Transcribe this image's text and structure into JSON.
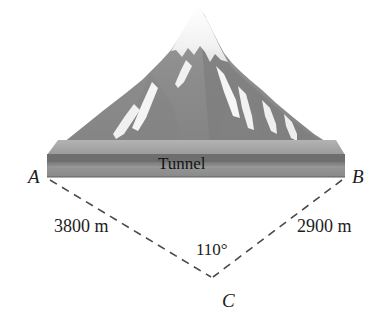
{
  "figure": {
    "type": "geometry-diagram",
    "background_color": "#ffffff"
  },
  "illustration": {
    "name": "mountain",
    "rock_color": "#8a8a8a",
    "rock_shadow_color": "#7b7b7b",
    "snow_color": "#f7f7f7",
    "slab_top_color": "#9d9d9d",
    "slab_band_color": "#6f6f6f",
    "slab_face_color": "#8f8f8f",
    "tunnel_label": "Tunnel"
  },
  "vertices": [
    {
      "id": "A",
      "label": "A",
      "x": 47,
      "y": 177
    },
    {
      "id": "B",
      "label": "B",
      "x": 345,
      "y": 177
    },
    {
      "id": "C",
      "label": "C",
      "x": 212,
      "y": 278
    }
  ],
  "measurements": {
    "side_AC": "3800 m",
    "side_BC": "2900 m",
    "angle_C": "110°"
  },
  "line_style": {
    "stroke_color": "#4a4a4a",
    "stroke_width": 1.6,
    "dash": "8 6"
  }
}
